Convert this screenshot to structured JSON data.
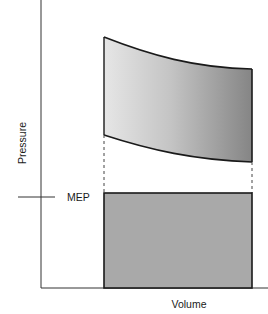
{
  "diagram": {
    "title": "",
    "axes": {
      "x_label": "Volume",
      "y_label": "Pressure"
    },
    "annotations": {
      "mep_label": "MEP"
    },
    "regions": [
      {
        "name": "pv-work-area",
        "description": "Curved region bounded by compression and expansion curves, shaded with a left-to-right gradient"
      },
      {
        "name": "mep-rectangle",
        "description": "Rectangle of equal area with height equal to mean effective pressure"
      }
    ],
    "colors": {
      "axis": "#333333",
      "outline": "#1a1a1a",
      "gradient_start": "#e6e6e6",
      "gradient_end": "#858585",
      "rect_fill": "#a9a9a9",
      "dash": "#444444"
    }
  }
}
